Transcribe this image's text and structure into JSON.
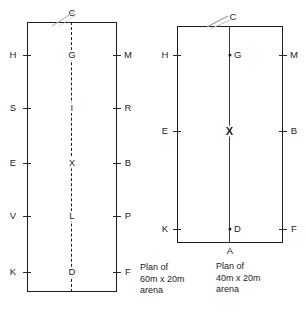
{
  "figure": {
    "title_hidden": "",
    "arenas": [
      {
        "id": "arena-60x20",
        "caption": "Plan of\n60m x 20m\narena",
        "centerline_style": "dashed",
        "top_marker": "C",
        "bottom_marker": "",
        "rows": [
          {
            "left": "H",
            "center": "G",
            "right": "M"
          },
          {
            "left": "S",
            "center": "I",
            "right": "R"
          },
          {
            "left": "E",
            "center": "X",
            "right": "B"
          },
          {
            "left": "V",
            "center": "L",
            "right": "P"
          },
          {
            "left": "K",
            "center": "D",
            "right": "F"
          }
        ]
      },
      {
        "id": "arena-40x20",
        "caption": "Plan of\n40m x 20m\narena",
        "centerline_style": "solid",
        "top_marker": "C",
        "bottom_marker": "A",
        "rows": [
          {
            "left": "H",
            "center": "G",
            "right": "M"
          },
          {
            "left": "E",
            "center": "X",
            "right": "B"
          },
          {
            "left": "K",
            "center": "D",
            "right": "F"
          }
        ]
      }
    ]
  },
  "colors": {
    "ink": "#1d1d1d",
    "text": "#232323",
    "paper": "#ffffff"
  }
}
